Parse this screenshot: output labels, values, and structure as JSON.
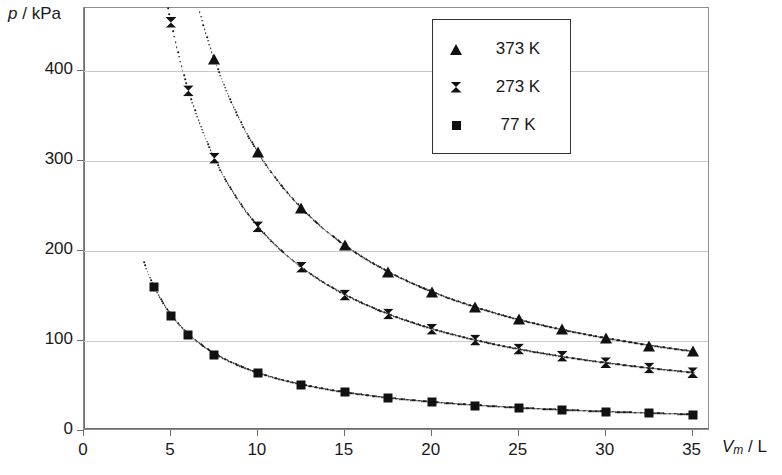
{
  "chart_data": {
    "type": "scatter",
    "title": "",
    "xlabel": "Vm / L",
    "xlabel_parts": {
      "symbol": "V",
      "subscript": "m",
      "separator": " / ",
      "unit": "L"
    },
    "ylabel": "p / kPa",
    "ylabel_parts": {
      "symbol": "p",
      "separator": " / ",
      "unit": "kPa"
    },
    "xlim": [
      0,
      36
    ],
    "ylim": [
      0,
      470
    ],
    "xticks": [
      0,
      5,
      10,
      15,
      20,
      25,
      30,
      35
    ],
    "yticks": [
      0,
      100,
      200,
      300,
      400
    ],
    "grid": "horizontal",
    "legend_position": "top-right",
    "x": [
      4,
      5,
      6,
      7.5,
      10,
      12.5,
      15,
      17.5,
      20,
      22.5,
      25,
      27.5,
      30,
      32.5,
      35
    ],
    "series": [
      {
        "name": "373 K",
        "marker": "triangle",
        "color": "#111111",
        "values": [
          775,
          620,
          517,
          413,
          310,
          248,
          207,
          177,
          155,
          138,
          124,
          113,
          103,
          95,
          89
        ]
      },
      {
        "name": "273 K",
        "marker": "bowtie",
        "color": "#111111",
        "values": [
          567,
          454,
          378,
          303,
          227,
          182,
          151,
          130,
          113,
          101,
          91,
          83,
          76,
          70,
          65
        ]
      },
      {
        "name": "77 K",
        "marker": "square",
        "color": "#111111",
        "values": [
          160,
          128,
          107,
          85,
          64,
          51,
          43,
          37,
          32,
          28,
          26,
          23,
          21,
          20,
          18
        ]
      }
    ],
    "legend": [
      {
        "label": "373 K",
        "marker": "triangle"
      },
      {
        "label": "273 K",
        "marker": "bowtie"
      },
      {
        "label": "77 K",
        "marker": "square"
      }
    ]
  }
}
